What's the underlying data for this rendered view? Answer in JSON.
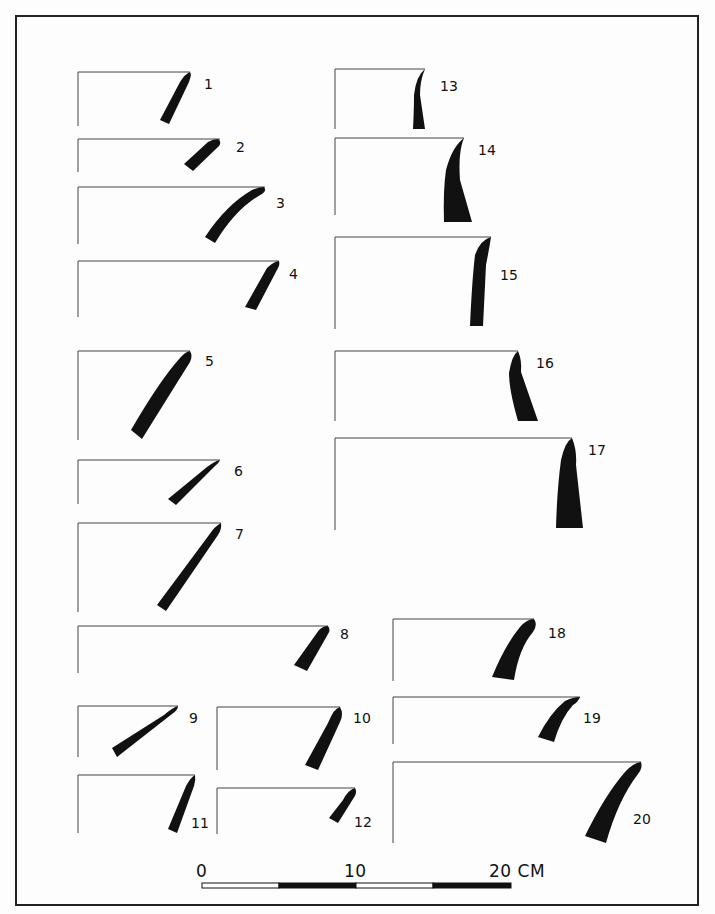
{
  "figure": {
    "profiles": [
      {
        "id": "1",
        "label": "1"
      },
      {
        "id": "2",
        "label": "2"
      },
      {
        "id": "3",
        "label": "3"
      },
      {
        "id": "4",
        "label": "4"
      },
      {
        "id": "5",
        "label": "5"
      },
      {
        "id": "6",
        "label": "6"
      },
      {
        "id": "7",
        "label": "7"
      },
      {
        "id": "8",
        "label": "8"
      },
      {
        "id": "9",
        "label": "9"
      },
      {
        "id": "10",
        "label": "10"
      },
      {
        "id": "11",
        "label": "11"
      },
      {
        "id": "12",
        "label": "12"
      },
      {
        "id": "13",
        "label": "13"
      },
      {
        "id": "14",
        "label": "14"
      },
      {
        "id": "15",
        "label": "15"
      },
      {
        "id": "16",
        "label": "16"
      },
      {
        "id": "17",
        "label": "17"
      },
      {
        "id": "18",
        "label": "18"
      },
      {
        "id": "19",
        "label": "19"
      },
      {
        "id": "20",
        "label": "20"
      }
    ],
    "scale_bar": {
      "labels": [
        "0",
        "10",
        "20 CM"
      ],
      "segments": [
        "white",
        "black",
        "white",
        "black"
      ]
    },
    "colors": {
      "ink": "#111111",
      "background": "#fdfdfd"
    }
  }
}
